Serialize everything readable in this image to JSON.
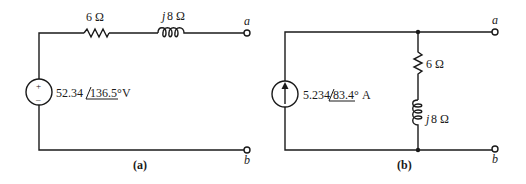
{
  "circuit_a": {
    "caption": "(a)",
    "source": {
      "type": "voltage",
      "magnitude": "52.34",
      "angle": "136.5°",
      "unit": "V",
      "plus": "+",
      "minus": "–"
    },
    "resistor": {
      "label": "6 Ω"
    },
    "inductor": {
      "prefix": "j",
      "label": "8 Ω"
    },
    "terminal_a": "a",
    "terminal_b": "b"
  },
  "circuit_b": {
    "caption": "(b)",
    "source": {
      "type": "current",
      "magnitude": "5.234",
      "angle": "83.4°",
      "unit": "A"
    },
    "resistor": {
      "label": "6 Ω"
    },
    "inductor": {
      "prefix": "j",
      "label": "8 Ω"
    },
    "terminal_a": "a",
    "terminal_b": "b"
  }
}
